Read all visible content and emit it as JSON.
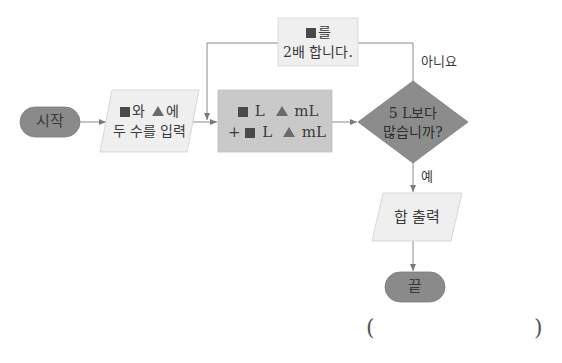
{
  "flowchart": {
    "start": {
      "label": "시작",
      "color": "#8a8a8a"
    },
    "input": {
      "line1_after_square": "와",
      "line1_after_triangle": "에",
      "line2": "두 수를 입력",
      "color": "#efefef"
    },
    "compute": {
      "row1": {
        "unit1": "L",
        "unit2": "mL"
      },
      "row2": {
        "operator": "+",
        "unit1": "L",
        "unit2": "mL"
      },
      "color": "#c9c9c9"
    },
    "loop_box": {
      "line1_after_square": "를",
      "line2": "2배 합니다.",
      "color": "#efefef"
    },
    "decision": {
      "line1": "5 L보다",
      "line2": "많습니까?",
      "color": "#8c8c8c"
    },
    "branch_no": "아니요",
    "branch_yes": "예",
    "output": {
      "label": "합 출력",
      "color": "#efefef"
    },
    "end": {
      "label": "끝",
      "color": "#8a8a8a"
    }
  },
  "answer_blank": {
    "open": "(",
    "close": ")"
  },
  "colors": {
    "line": "#8a8a8a",
    "symbol_dark": "#4a4a4a",
    "symbol_triangle": "#6a6a6a"
  }
}
